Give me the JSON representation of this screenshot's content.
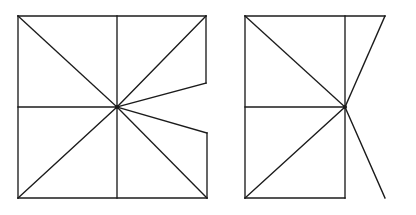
{
  "document": {
    "title": "Two line-drawing figures",
    "description": "Side-by-side geometric wireframe figures made of straight black line segments on a white background",
    "background_color": "#ffffff",
    "stroke_color": "#1b1b1b",
    "stroke_width": 1.35,
    "canvas": {
      "width": 416,
      "height": 215
    }
  },
  "figures": [
    {
      "id": "left-figure",
      "name": "notched-rectangle-star",
      "label": "Left figure",
      "description": "Rectangle whose right edge is notched inward into a concave V, with eight line segments radiating from the center point",
      "center": {
        "x": 117,
        "y": 107
      },
      "bounds": {
        "left": 18,
        "top": 16,
        "right": 207,
        "bottom": 198
      },
      "vertices": {
        "top_left": {
          "x": 18,
          "y": 16
        },
        "top_right": {
          "x": 206,
          "y": 16
        },
        "bottom_left": {
          "x": 18,
          "y": 198
        },
        "bottom_right": {
          "x": 207,
          "y": 198
        },
        "left_mid": {
          "x": 18,
          "y": 107
        },
        "top_mid": {
          "x": 117,
          "y": 16
        },
        "bottom_mid": {
          "x": 117,
          "y": 198
        },
        "notch_upper": {
          "x": 206,
          "y": 83
        },
        "notch_lower": {
          "x": 207,
          "y": 133
        }
      },
      "segments": [
        {
          "name": "top-edge",
          "x1": 18,
          "y1": 16,
          "x2": 206,
          "y2": 16
        },
        {
          "name": "left-edge",
          "x1": 18,
          "y1": 16,
          "x2": 18,
          "y2": 198
        },
        {
          "name": "bottom-edge",
          "x1": 18,
          "y1": 198,
          "x2": 207,
          "y2": 198
        },
        {
          "name": "right-edge-upper",
          "x1": 206,
          "y1": 16,
          "x2": 206,
          "y2": 83
        },
        {
          "name": "right-edge-lower",
          "x1": 207,
          "y1": 133,
          "x2": 207,
          "y2": 198
        },
        {
          "name": "notch-upper-to-center",
          "x1": 206,
          "y1": 83,
          "x2": 117,
          "y2": 107
        },
        {
          "name": "notch-lower-to-center",
          "x1": 207,
          "y1": 133,
          "x2": 117,
          "y2": 107
        },
        {
          "name": "center-to-top-left",
          "x1": 117,
          "y1": 107,
          "x2": 18,
          "y2": 16
        },
        {
          "name": "center-to-top-right",
          "x1": 117,
          "y1": 107,
          "x2": 206,
          "y2": 16
        },
        {
          "name": "center-to-bottom-left",
          "x1": 117,
          "y1": 107,
          "x2": 18,
          "y2": 198
        },
        {
          "name": "center-to-bottom-right",
          "x1": 117,
          "y1": 107,
          "x2": 207,
          "y2": 198
        },
        {
          "name": "center-to-left-mid",
          "x1": 117,
          "y1": 107,
          "x2": 18,
          "y2": 107
        },
        {
          "name": "center-to-top-mid",
          "x1": 117,
          "y1": 107,
          "x2": 117,
          "y2": 16
        },
        {
          "name": "center-to-bottom-mid",
          "x1": 117,
          "y1": 107,
          "x2": 117,
          "y2": 198
        }
      ]
    },
    {
      "id": "right-figure",
      "name": "open-bowtie-rectangle",
      "label": "Right figure",
      "description": "Left half is a closed rectangle grid; the right half is an open bowtie with two diagonals reaching the top-right and bottom-right points and no closing right or lower-right edge",
      "center": {
        "x": 345,
        "y": 107
      },
      "bounds": {
        "left": 245,
        "top": 16,
        "right": 385,
        "bottom": 198
      },
      "vertices": {
        "top_left": {
          "x": 245,
          "y": 16
        },
        "top_right": {
          "x": 385,
          "y": 16
        },
        "bottom_left": {
          "x": 245,
          "y": 198
        },
        "bottom_right": {
          "x": 385,
          "y": 198
        },
        "left_mid": {
          "x": 245,
          "y": 107
        },
        "top_mid": {
          "x": 345,
          "y": 16
        },
        "bottom_mid": {
          "x": 345,
          "y": 198
        }
      },
      "segments": [
        {
          "name": "top-edge",
          "x1": 245,
          "y1": 16,
          "x2": 385,
          "y2": 16
        },
        {
          "name": "left-edge",
          "x1": 245,
          "y1": 16,
          "x2": 245,
          "y2": 198
        },
        {
          "name": "bottom-edge-left-half",
          "x1": 245,
          "y1": 198,
          "x2": 345,
          "y2": 198
        },
        {
          "name": "middle-vertical-upper",
          "x1": 345,
          "y1": 16,
          "x2": 345,
          "y2": 107
        },
        {
          "name": "middle-vertical-lower",
          "x1": 345,
          "y1": 107,
          "x2": 345,
          "y2": 198
        },
        {
          "name": "middle-horizontal-left-half",
          "x1": 245,
          "y1": 107,
          "x2": 345,
          "y2": 107
        },
        {
          "name": "center-to-top-left",
          "x1": 345,
          "y1": 107,
          "x2": 245,
          "y2": 16
        },
        {
          "name": "center-to-bottom-left",
          "x1": 345,
          "y1": 107,
          "x2": 245,
          "y2": 198
        },
        {
          "name": "center-to-top-right",
          "x1": 345,
          "y1": 107,
          "x2": 385,
          "y2": 16
        },
        {
          "name": "center-to-bottom-right",
          "x1": 345,
          "y1": 107,
          "x2": 385,
          "y2": 198
        }
      ]
    }
  ]
}
